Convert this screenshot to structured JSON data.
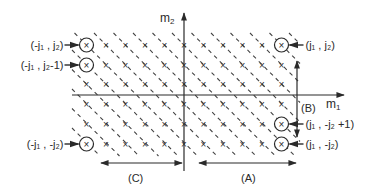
{
  "diagram": {
    "title": "",
    "axes": {
      "horizontal": {
        "label_main": "m",
        "label_sub": "1"
      },
      "vertical": {
        "label_main": "m",
        "label_sub": "2"
      }
    },
    "grid": {
      "m1_min": -5,
      "m1_max": 5,
      "m2_values": [
        3,
        2,
        1,
        -1,
        -2,
        -3
      ],
      "point_marker": "×",
      "diagonal_line_style": "dashed"
    },
    "circled_points": [
      {
        "id": "top-left",
        "m1": -5,
        "m2": 3,
        "label": "(-j₁ , j₂)",
        "side": "left"
      },
      {
        "id": "second-left",
        "m1": -5,
        "m2": 2,
        "label": "(-j₁ , j₂-1)",
        "side": "left"
      },
      {
        "id": "top-right",
        "m1": 5,
        "m2": 3,
        "label": "(j₁ , j₂)",
        "side": "right"
      },
      {
        "id": "bottom-left",
        "m1": -5,
        "m2": -3,
        "label": "(-j₁ , -j₂)",
        "side": "left"
      },
      {
        "id": "second-right-bottom",
        "m1": 5,
        "m2": -2,
        "label": "(j₁ , -j₂ +1)",
        "side": "right"
      },
      {
        "id": "bottom-right",
        "m1": 5,
        "m2": -3,
        "label": "(j₁ , -j₂)",
        "side": "right"
      }
    ],
    "regions": {
      "A": {
        "label": "(A)"
      },
      "B": {
        "label": "(B)"
      },
      "C": {
        "label": "(C)"
      }
    }
  }
}
